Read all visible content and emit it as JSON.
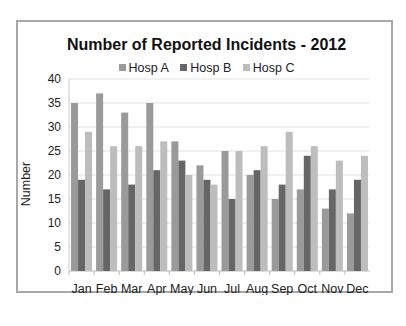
{
  "chart_data": {
    "type": "bar",
    "title": "Number of Reported Incidents - 2012",
    "xlabel": "",
    "ylabel": "Number",
    "ylim": [
      0,
      40
    ],
    "yticks": [
      0,
      5,
      10,
      15,
      20,
      25,
      30,
      35,
      40
    ],
    "grid": true,
    "legend_position": "top",
    "categories": [
      "Jan",
      "Feb",
      "Mar",
      "Apr",
      "May",
      "Jun",
      "Jul",
      "Aug",
      "Sep",
      "Oct",
      "Nov",
      "Dec"
    ],
    "series": [
      {
        "name": "Hosp A",
        "color": "#9a9a9a",
        "values": [
          35,
          37,
          33,
          35,
          27,
          22,
          25,
          20,
          15,
          17,
          13,
          12
        ]
      },
      {
        "name": "Hosp B",
        "color": "#666666",
        "values": [
          19,
          17,
          18,
          21,
          23,
          19,
          15,
          21,
          18,
          24,
          17,
          19
        ]
      },
      {
        "name": "Hosp C",
        "color": "#bdbdbd",
        "values": [
          29,
          26,
          26,
          27,
          20,
          18,
          25,
          26,
          29,
          26,
          23,
          24
        ]
      }
    ]
  }
}
